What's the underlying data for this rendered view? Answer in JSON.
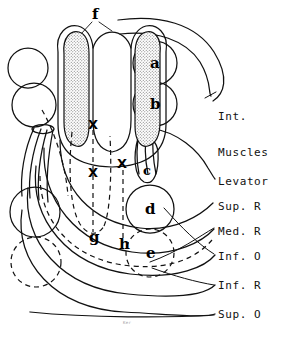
{
  "figure": {
    "type": "anatomical-line-diagram",
    "stroke_color": "#111111",
    "stipple_color": "#7a7a7a",
    "background": "#ffffff",
    "width": 291,
    "height": 340
  },
  "right_labels": [
    {
      "id": "int-muscles",
      "line1": "Int.",
      "line2": "Muscles",
      "x": 218,
      "y": 92
    },
    {
      "id": "levator",
      "text": "Levator",
      "x": 218,
      "y": 181
    },
    {
      "id": "sup-r",
      "text": "Sup. R",
      "x": 218,
      "y": 206
    },
    {
      "id": "med-r",
      "text": "Med. R",
      "x": 218,
      "y": 231
    },
    {
      "id": "inf-o",
      "text": "Inf. O",
      "x": 218,
      "y": 256
    },
    {
      "id": "inf-r",
      "text": "Inf. R",
      "x": 218,
      "y": 285
    },
    {
      "id": "sup-o",
      "text": "Sup. O",
      "x": 218,
      "y": 314
    }
  ],
  "structure_labels": [
    {
      "id": "a",
      "text": "a",
      "x": 150,
      "y": 63,
      "kind": "circle-solid"
    },
    {
      "id": "b",
      "text": "b",
      "x": 150,
      "y": 104,
      "kind": "circle-solid"
    },
    {
      "id": "c",
      "text": "c",
      "x": 148,
      "y": 170,
      "kind": "ellipse-narrow"
    },
    {
      "id": "d",
      "text": "d",
      "x": 147,
      "y": 209,
      "kind": "circle-solid"
    },
    {
      "id": "e",
      "text": "e",
      "x": 148,
      "y": 252,
      "kind": "circle-dashed"
    },
    {
      "id": "f",
      "text": "f",
      "x": 93,
      "y": 13,
      "kind": "stippled-lobes"
    },
    {
      "id": "g",
      "text": "g",
      "x": 92,
      "y": 236,
      "kind": "dashed-path"
    },
    {
      "id": "h",
      "text": "h",
      "x": 122,
      "y": 243,
      "kind": "dashed-path"
    }
  ],
  "x_marks": [
    {
      "id": "x-top",
      "text": "X",
      "x": 88,
      "y": 124
    },
    {
      "id": "x-mid",
      "text": "X",
      "x": 88,
      "y": 172
    },
    {
      "id": "x-right",
      "text": "X",
      "x": 117,
      "y": 163
    }
  ],
  "bottom_mark": {
    "text": "Ker",
    "x": 123,
    "y": 322
  }
}
